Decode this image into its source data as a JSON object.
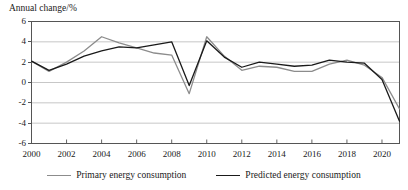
{
  "chart_data": {
    "type": "line",
    "title": "",
    "ylabel": "Annual change/%",
    "xlabel": "",
    "ylim": [
      -6,
      6
    ],
    "xlim": [
      2000,
      2021
    ],
    "yticks": [
      6,
      4,
      2,
      0,
      -2,
      -4,
      -6
    ],
    "ytick_labels": [
      "6",
      "4",
      "2",
      "0",
      "-2",
      "-4",
      "-6"
    ],
    "xticks": [
      2000,
      2002,
      2004,
      2006,
      2008,
      2010,
      2012,
      2014,
      2016,
      2018,
      2020
    ],
    "xtick_labels": [
      "2000",
      "2002",
      "2004",
      "2006",
      "2008",
      "2010",
      "2012",
      "2014",
      "2016",
      "2018",
      "2020"
    ],
    "grid": "horizontal",
    "legend_position": "bottom",
    "x": [
      2000,
      2001,
      2002,
      2003,
      2004,
      2005,
      2006,
      2007,
      2008,
      2009,
      2010,
      2011,
      2012,
      2013,
      2014,
      2015,
      2016,
      2017,
      2018,
      2019,
      2020,
      2021
    ],
    "series": [
      {
        "name": "Primary energy consumption",
        "color": "#8c8c8c",
        "values": [
          2.1,
          1.1,
          2.0,
          3.1,
          4.5,
          3.9,
          3.4,
          2.9,
          2.7,
          -1.1,
          4.5,
          2.6,
          1.2,
          1.6,
          1.5,
          1.1,
          1.1,
          1.8,
          2.2,
          1.7,
          0.5,
          -2.6
        ]
      },
      {
        "name": "Predicted energy consumption",
        "color": "#1a1a1a",
        "values": [
          2.1,
          1.2,
          1.8,
          2.6,
          3.1,
          3.5,
          3.4,
          3.7,
          4.0,
          -0.3,
          4.1,
          2.5,
          1.5,
          2.0,
          1.8,
          1.6,
          1.7,
          2.2,
          2.0,
          1.9,
          0.3,
          -3.8
        ]
      }
    ]
  },
  "legend": {
    "items": [
      {
        "label": "Primary energy consumption"
      },
      {
        "label": "Predicted energy consumption"
      }
    ]
  }
}
